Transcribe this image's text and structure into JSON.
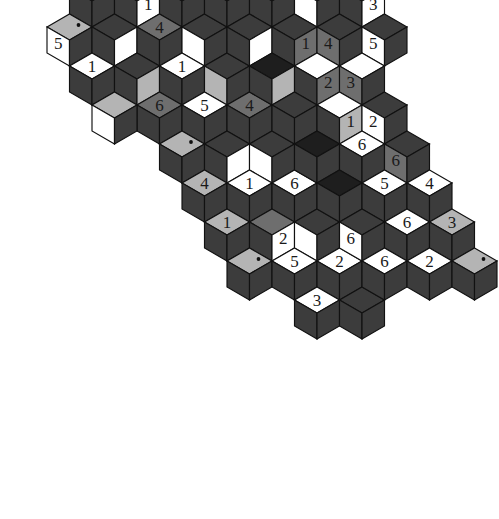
{
  "puzzle": {
    "title": "Rhombille cube tiling puzzle",
    "type": "rhombille-tiling",
    "canvas": {
      "width": 499,
      "height": 519,
      "background": "#ffffff"
    },
    "palette": {
      "white": "#ffffff",
      "light_gray": "#b4b4b4",
      "mid_gray": "#6e6e6e",
      "dark_gray": "#3c3c3c",
      "near_black": "#1e1e1e",
      "outline": "#111111",
      "label_on_dark": "#ffffff",
      "label_on_light": "#1a1a1a"
    },
    "geometry": {
      "rhomb_half_width": 22.5,
      "rhomb_quarter_height": 13.0,
      "origin_x": 249.5,
      "origin_y": 40.0,
      "note": "Three rhombus orientations per cube: top, left face, right face."
    },
    "legend": {
      "face_top": "top",
      "face_left": "left",
      "face_right": "right"
    },
    "numbers_used": [
      "1",
      "2",
      "3",
      "4",
      "5",
      "6"
    ]
  },
  "cubes": [
    {
      "q": -1,
      "r": -3,
      "top": "near_black",
      "left": "near_black",
      "right": "mid_gray",
      "dot": "top",
      "labels": {}
    },
    {
      "q": 1,
      "r": -4,
      "top": "mid_gray",
      "left": "near_black",
      "right": "light_gray",
      "dot": "top",
      "labels": {}
    },
    {
      "q": -2,
      "r": -2,
      "top": "mid_gray",
      "left": "dark_gray",
      "right": "dark_gray",
      "labels": {
        "top": "6"
      }
    },
    {
      "q": -1,
      "r": -2,
      "top": "near_black",
      "left": "dark_gray",
      "right": "white",
      "labels": {
        "left": "6"
      }
    },
    {
      "q": 0,
      "r": -3,
      "top": "near_black",
      "left": "mid_gray",
      "right": "near_black",
      "labels": {
        "left": "5"
      }
    },
    {
      "q": 1,
      "r": -3,
      "top": "near_black",
      "left": "mid_gray",
      "right": "dark_gray",
      "labels": {
        "left": "2"
      }
    },
    {
      "q": 2,
      "r": -3,
      "top": "dark_gray",
      "left": "white",
      "right": "dark_gray",
      "labels": {
        "left": "4"
      }
    },
    {
      "q": 3,
      "r": -3,
      "top": "light_gray",
      "left": "dark_gray",
      "right": "mid_gray",
      "labels": {
        "left": "1"
      }
    },
    {
      "q": 4,
      "r": -3,
      "top": "light_gray",
      "left": "mid_gray",
      "right": "dark_gray",
      "labels": {
        "left": "5"
      }
    },
    {
      "q": -3,
      "r": -1,
      "top": "mid_gray",
      "left": "dark_gray",
      "right": "dark_gray",
      "labels": {
        "top": "3"
      }
    },
    {
      "q": -2,
      "r": -1,
      "top": "dark_gray",
      "left": "dark_gray",
      "right": "white",
      "labels": {
        "right": "1"
      }
    },
    {
      "q": -1,
      "r": -1,
      "top": "dark_gray",
      "left": "dark_gray",
      "right": "dark_gray",
      "labels": {}
    },
    {
      "q": 0,
      "r": -2,
      "top": "dark_gray",
      "left": "white",
      "right": "dark_gray",
      "labels": {}
    },
    {
      "q": 1,
      "r": -2,
      "top": "dark_gray",
      "left": "light_gray",
      "right": "dark_gray",
      "labels": {
        "left": "3"
      }
    },
    {
      "q": 2,
      "r": -2,
      "top": "dark_gray",
      "left": "dark_gray",
      "right": "white",
      "labels": {}
    },
    {
      "q": 3,
      "r": -2,
      "top": "light_gray",
      "left": "dark_gray",
      "right": "light_gray",
      "dot": "top",
      "labels": {}
    },
    {
      "q": -4,
      "r": 0,
      "top": "light_gray",
      "left": "white",
      "right": "dark_gray",
      "dot": "top",
      "labels": {
        "left": "5"
      }
    },
    {
      "q": -3,
      "r": 0,
      "top": "dark_gray",
      "left": "dark_gray",
      "right": "white",
      "labels": {}
    },
    {
      "q": -2,
      "r": 0,
      "top": "mid_gray",
      "left": "dark_gray",
      "right": "dark_gray",
      "labels": {
        "top": "4"
      }
    },
    {
      "q": -1,
      "r": 0,
      "top": "dark_gray",
      "left": "white",
      "right": "dark_gray",
      "labels": {}
    },
    {
      "q": 0,
      "r": -1,
      "top": "near_black",
      "left": "dark_gray",
      "right": "dark_gray",
      "labels": {}
    },
    {
      "q": 1,
      "r": -1,
      "top": "white",
      "left": "dark_gray",
      "right": "dark_gray",
      "labels": {
        "top": "1"
      }
    },
    {
      "q": 2,
      "r": -1,
      "top": "dark_gray",
      "left": "white",
      "right": "dark_gray",
      "labels": {}
    },
    {
      "q": 3,
      "r": -1,
      "top": "dark_gray",
      "left": "dark_gray",
      "right": "white",
      "labels": {
        "right": "3"
      }
    },
    {
      "q": -4,
      "r": 1,
      "top": "white",
      "left": "dark_gray",
      "right": "dark_gray",
      "labels": {
        "top": "1"
      }
    },
    {
      "q": -3,
      "r": 1,
      "top": "dark_gray",
      "left": "dark_gray",
      "right": "light_gray",
      "labels": {}
    },
    {
      "q": -2,
      "r": 1,
      "top": "white",
      "left": "dark_gray",
      "right": "dark_gray",
      "labels": {
        "top": "1"
      }
    },
    {
      "q": -1,
      "r": 1,
      "top": "dark_gray",
      "left": "light_gray",
      "right": "dark_gray",
      "labels": {}
    },
    {
      "q": 0,
      "r": 0,
      "top": "dark_gray",
      "left": "dark_gray",
      "right": "white",
      "labels": {}
    },
    {
      "q": 1,
      "r": 0,
      "top": "dark_gray",
      "left": "dark_gray",
      "right": "mid_gray",
      "labels": {
        "right": "1"
      }
    },
    {
      "q": 2,
      "r": 0,
      "top": "dark_gray",
      "left": "mid_gray",
      "right": "dark_gray",
      "labels": {
        "left": "4"
      }
    },
    {
      "q": 3,
      "r": 0,
      "top": "dark_gray",
      "left": "white",
      "right": "dark_gray",
      "labels": {
        "left": "5"
      }
    },
    {
      "q": -3,
      "r": 2,
      "top": "mid_gray",
      "left": "dark_gray",
      "right": "dark_gray",
      "labels": {
        "top": "6"
      }
    },
    {
      "q": -2,
      "r": 2,
      "top": "white",
      "left": "dark_gray",
      "right": "dark_gray",
      "labels": {
        "top": "5"
      }
    },
    {
      "q": -1,
      "r": 2,
      "top": "mid_gray",
      "left": "dark_gray",
      "right": "dark_gray",
      "labels": {
        "top": "4"
      }
    },
    {
      "q": 0,
      "r": 1,
      "top": "near_black",
      "left": "dark_gray",
      "right": "light_gray",
      "labels": {}
    },
    {
      "q": 1,
      "r": 1,
      "top": "white",
      "left": "dark_gray",
      "right": "mid_gray",
      "labels": {
        "right": "2"
      }
    },
    {
      "q": 2,
      "r": 1,
      "top": "white",
      "left": "mid_gray",
      "right": "dark_gray",
      "labels": {
        "left": "3"
      }
    },
    {
      "q": -3,
      "r": 3,
      "top": "light_gray",
      "left": "dark_gray",
      "right": "dark_gray",
      "dot": "top",
      "labels": {}
    },
    {
      "q": -2,
      "r": 3,
      "top": "dark_gray",
      "left": "dark_gray",
      "right": "white",
      "labels": {}
    },
    {
      "q": -1,
      "r": 3,
      "top": "dark_gray",
      "left": "white",
      "right": "dark_gray",
      "labels": {}
    },
    {
      "q": 0,
      "r": 2,
      "top": "dark_gray",
      "left": "dark_gray",
      "right": "dark_gray",
      "labels": {}
    },
    {
      "q": 1,
      "r": 2,
      "top": "white",
      "left": "dark_gray",
      "right": "light_gray",
      "labels": {
        "right": "1"
      }
    },
    {
      "q": 2,
      "r": 2,
      "top": "dark_gray",
      "left": "white",
      "right": "dark_gray",
      "labels": {
        "left": "2"
      }
    },
    {
      "q": -3,
      "r": 4,
      "top": "light_gray",
      "left": "dark_gray",
      "right": "dark_gray",
      "labels": {
        "top": "4"
      }
    },
    {
      "q": -2,
      "r": 4,
      "top": "white",
      "left": "dark_gray",
      "right": "dark_gray",
      "labels": {
        "top": "1"
      }
    },
    {
      "q": -1,
      "r": 4,
      "top": "white",
      "left": "dark_gray",
      "right": "dark_gray",
      "labels": {
        "top": "6"
      }
    },
    {
      "q": 0,
      "r": 3,
      "top": "near_black",
      "left": "dark_gray",
      "right": "dark_gray",
      "labels": {}
    },
    {
      "q": 1,
      "r": 3,
      "top": "white",
      "left": "dark_gray",
      "right": "dark_gray",
      "labels": {
        "top": "6"
      }
    },
    {
      "q": 2,
      "r": 3,
      "top": "dark_gray",
      "left": "mid_gray",
      "right": "dark_gray",
      "labels": {
        "left": "6"
      }
    },
    {
      "q": -3,
      "r": 5,
      "top": "light_gray",
      "left": "dark_gray",
      "right": "dark_gray",
      "labels": {
        "top": "1"
      }
    },
    {
      "q": -2,
      "r": 5,
      "top": "mid_gray",
      "left": "dark_gray",
      "right": "white",
      "labels": {
        "right": "2"
      }
    },
    {
      "q": -1,
      "r": 5,
      "top": "dark_gray",
      "left": "white",
      "right": "dark_gray",
      "labels": {}
    },
    {
      "q": 0,
      "r": 4,
      "top": "near_black",
      "left": "dark_gray",
      "right": "dark_gray",
      "labels": {}
    },
    {
      "q": 1,
      "r": 4,
      "top": "white",
      "left": "dark_gray",
      "right": "dark_gray",
      "labels": {
        "top": "5"
      }
    },
    {
      "q": 2,
      "r": 4,
      "top": "white",
      "left": "dark_gray",
      "right": "dark_gray",
      "labels": {
        "top": "4"
      }
    },
    {
      "q": -3,
      "r": 6,
      "top": "light_gray",
      "left": "dark_gray",
      "right": "dark_gray",
      "dot": "top",
      "labels": {}
    },
    {
      "q": -2,
      "r": 6,
      "top": "white",
      "left": "dark_gray",
      "right": "dark_gray",
      "labels": {
        "top": "5"
      }
    },
    {
      "q": -1,
      "r": 6,
      "top": "white",
      "left": "dark_gray",
      "right": "dark_gray",
      "labels": {
        "top": "2"
      }
    },
    {
      "q": 0,
      "r": 5,
      "top": "dark_gray",
      "left": "white",
      "right": "dark_gray",
      "labels": {
        "left": "6"
      }
    },
    {
      "q": 1,
      "r": 5,
      "top": "white",
      "left": "dark_gray",
      "right": "dark_gray",
      "labels": {
        "top": "6"
      }
    },
    {
      "q": 2,
      "r": 5,
      "top": "light_gray",
      "left": "dark_gray",
      "right": "dark_gray",
      "labels": {
        "top": "3"
      }
    },
    {
      "q": -2,
      "r": 7,
      "top": "white",
      "left": "dark_gray",
      "right": "dark_gray",
      "labels": {
        "top": "3"
      }
    },
    {
      "q": -1,
      "r": 7,
      "top": "dark_gray",
      "left": "dark_gray",
      "right": "dark_gray",
      "labels": {}
    },
    {
      "q": 0,
      "r": 6,
      "top": "white",
      "left": "dark_gray",
      "right": "dark_gray",
      "labels": {
        "top": "6"
      }
    },
    {
      "q": 1,
      "r": 6,
      "top": "white",
      "left": "dark_gray",
      "right": "dark_gray",
      "labels": {
        "top": "2"
      }
    },
    {
      "q": 2,
      "r": 6,
      "top": "light_gray",
      "left": "dark_gray",
      "right": "dark_gray",
      "dot": "top",
      "labels": {}
    },
    {
      "q": -4,
      "r": 2,
      "top": "light_gray",
      "left": "white",
      "right": "dark_gray",
      "labels": {}
    },
    {
      "q": 4,
      "r": -2,
      "top": "light_gray",
      "left": "white",
      "right": "dark_gray",
      "labels": {
        "left": "5"
      }
    },
    {
      "q": -1,
      "r": -4,
      "top": "light_gray",
      "left": "near_black",
      "right": "near_black",
      "labels": {}
    },
    {
      "q": 2,
      "r": -4,
      "top": "light_gray",
      "left": "near_black",
      "right": "near_black",
      "labels": {}
    }
  ],
  "visible_numbers": {
    "counts": {
      "1": 9,
      "2": 7,
      "3": 7,
      "4": 7,
      "5": 8,
      "6": 10
    },
    "all": [
      "6",
      "5",
      "2",
      "4",
      "1",
      "5",
      "3",
      "1",
      "3",
      "1",
      "5",
      "4",
      "1",
      "3",
      "1",
      "4",
      "5",
      "1",
      "6",
      "5",
      "4",
      "2",
      "3",
      "1",
      "2",
      "6",
      "1",
      "2",
      "6",
      "6",
      "4",
      "1",
      "6",
      "2",
      "5",
      "4",
      "1",
      "5",
      "2",
      "6",
      "3",
      "2",
      "3",
      "6",
      "2",
      "6"
    ]
  }
}
